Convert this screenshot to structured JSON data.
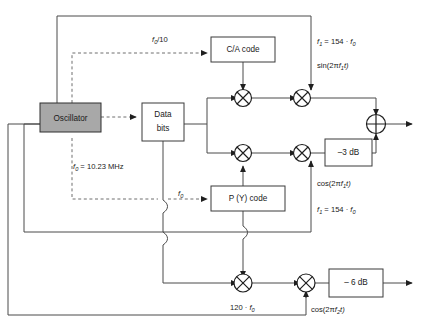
{
  "diagram": {
    "blocks": [
      {
        "id": "oscillator",
        "label": "Oscillator",
        "fill": "#a8a8a8"
      },
      {
        "id": "ca-code",
        "label": "C/A code",
        "fill": "#ffffff"
      },
      {
        "id": "data-bits",
        "label_line1": "Data",
        "label_line2": "bits",
        "fill": "#ffffff"
      },
      {
        "id": "py-code",
        "label": "P (Y) code",
        "fill": "#ffffff"
      },
      {
        "id": "atten-3db",
        "label": "–3 dB",
        "fill": "#ffffff"
      },
      {
        "id": "atten-6db",
        "label": "– 6 dB",
        "fill": "#ffffff"
      }
    ],
    "nodes": [
      {
        "id": "mixer-ca-data",
        "type": "mixer"
      },
      {
        "id": "mixer-l1-inphase",
        "type": "mixer"
      },
      {
        "id": "mixer-py-data",
        "type": "mixer"
      },
      {
        "id": "mixer-l1-quadrature",
        "type": "mixer"
      },
      {
        "id": "mixer-py-data-l2",
        "type": "mixer"
      },
      {
        "id": "mixer-l2-carrier",
        "type": "mixer"
      },
      {
        "id": "summer",
        "type": "adder"
      }
    ],
    "labels": {
      "osc_freq": "f0 = 10.23 MHz",
      "osc_freq_main": "f",
      "osc_freq_sub": "0",
      "osc_freq_rest": " = 10.23 MHz",
      "ca_clock_main": "f",
      "ca_clock_sub": "0",
      "ca_clock_rest": "/10",
      "py_clock_main": "f",
      "py_clock_sub": "0",
      "l1_freq_top": "f1 = 154 · f0",
      "l1_carrier_sin": "sin(2πf1t)",
      "l1_carrier_cos": "cos(2πf1t)",
      "l1_freq_bottom": "f1 = 154 · f0",
      "l2_multiplier": "120 · f0",
      "l2_carrier_cos": "cos(2πf2t)"
    },
    "label_parts": {
      "l1_freq": {
        "a": "f",
        "a_sub": "1",
        "b": " = 154 · ",
        "c": "f",
        "c_sub": "0"
      },
      "sin_carrier": {
        "a": "sin(2",
        "pi": "π",
        "f": "f",
        "f_sub": "1",
        "t": "t)"
      },
      "cos_carrier_1": {
        "a": "cos(2",
        "pi": "π",
        "f": "f",
        "f_sub": "1",
        "t": "t)"
      },
      "cos_carrier_2": {
        "a": "cos(2",
        "pi": "π",
        "f": "f",
        "f_sub": "2",
        "t": "t)"
      },
      "l2_mult": {
        "a": "120 · ",
        "f": "f",
        "f_sub": "0"
      },
      "osc": {
        "f": "f",
        "f_sub": "0",
        "rest": " = 10.23 MHz"
      },
      "ca_clk": {
        "f": "f",
        "f_sub": "0",
        "rest": "/10"
      },
      "py_clk": {
        "f": "f",
        "f_sub": "0"
      }
    },
    "colors": {
      "oscillator_fill": "#a8a8a8",
      "wire": "#4a4a4a",
      "dashed_wire": "#6e6e6e",
      "box_stroke": "#3a3a3a",
      "text": "#1a1a1a"
    }
  }
}
